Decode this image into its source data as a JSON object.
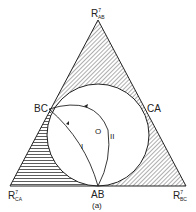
{
  "figure": {
    "caption": "(a)",
    "vertices": {
      "top": {
        "base": "R",
        "sup": "7",
        "sub": "AB"
      },
      "bottom_left": {
        "base": "R",
        "sup": "7",
        "sub": "CA"
      },
      "bottom_right": {
        "base": "R",
        "sup": "7",
        "sub": "BC"
      }
    },
    "tangent_points": {
      "left": "BC",
      "right": "CA",
      "bottom": "AB"
    },
    "center_label": "O",
    "path_labels": {
      "path1": "I",
      "path2": "II"
    },
    "colors": {
      "line": "#222222",
      "background": "#ffffff"
    }
  }
}
